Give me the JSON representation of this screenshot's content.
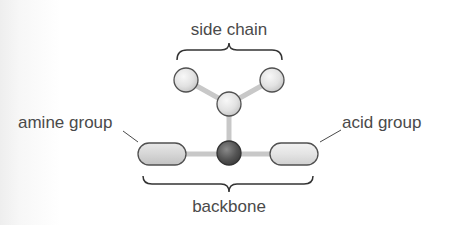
{
  "diagram": {
    "labels": {
      "side_chain": "side chain",
      "amine_group": "amine group",
      "acid_group": "acid group",
      "backbone": "backbone"
    },
    "colors": {
      "text": "#4a4a4a",
      "bond": "#c8c8c8",
      "outline": "#505050",
      "light_atom": "#e4e4e4",
      "central_atom": "#555555",
      "brace": "#333333"
    },
    "components": [
      {
        "id": "side-chain-atom-left",
        "type": "circle",
        "group": "side chain"
      },
      {
        "id": "side-chain-atom-right",
        "type": "circle",
        "group": "side chain"
      },
      {
        "id": "side-chain-atom-middle",
        "type": "circle",
        "group": "side chain"
      },
      {
        "id": "alpha-carbon",
        "type": "circle",
        "group": "backbone"
      },
      {
        "id": "amine-group",
        "type": "pill",
        "group": "backbone"
      },
      {
        "id": "acid-group",
        "type": "pill",
        "group": "backbone"
      }
    ]
  }
}
